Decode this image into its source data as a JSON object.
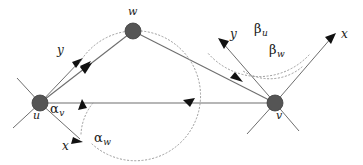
{
  "figure": {
    "type": "diagram",
    "background_color": "#ffffff",
    "node_color": "#555555",
    "line_color": "#6e6e6e",
    "arc_color": "#9a9a9a",
    "arrow_color": "#111111",
    "width": 363,
    "height": 165
  },
  "nodes": [
    {
      "id": "u",
      "label": "u",
      "x": 40,
      "y": 103,
      "radius": 8,
      "label_x": 33,
      "label_y": 112
    },
    {
      "id": "w",
      "label": "w",
      "x": 133,
      "y": 31,
      "radius": 8,
      "label_x": 128,
      "label_y": 9
    },
    {
      "id": "v",
      "label": "v",
      "x": 275,
      "y": 103,
      "radius": 8,
      "label_x": 275,
      "label_y": 112
    }
  ],
  "edges": [
    {
      "id": "u-w",
      "from": "u",
      "to": "w",
      "directed": true
    },
    {
      "id": "u-v",
      "from": "u",
      "to": "v",
      "directed": true
    },
    {
      "id": "w-v",
      "from": "w",
      "to": "v",
      "directed": true
    }
  ],
  "axes": [
    {
      "id": "u-y",
      "node": "u",
      "label": "y",
      "label_x": 58,
      "label_y": 47
    },
    {
      "id": "u-x",
      "node": "u",
      "label": "x",
      "label_x": 63,
      "label_y": 142
    },
    {
      "id": "v-y",
      "node": "v",
      "label": "y",
      "label_x": 230,
      "label_y": 30
    },
    {
      "id": "v-x",
      "node": "v",
      "label": "x",
      "label_x": 341,
      "label_y": 30
    }
  ],
  "angles": [
    {
      "id": "alpha-v",
      "symbol": "α",
      "subscript": "v",
      "at_node": "u",
      "label_x": 50,
      "label_y": 105
    },
    {
      "id": "alpha-w",
      "symbol": "α",
      "subscript": "w",
      "at_node": "u",
      "label_x": 96,
      "label_y": 134
    },
    {
      "id": "beta-u",
      "symbol": "β",
      "subscript": "u",
      "at_node": "v",
      "label_x": 255,
      "label_y": 25
    },
    {
      "id": "beta-w",
      "symbol": "β",
      "subscript": "w",
      "at_node": "v",
      "label_x": 270,
      "label_y": 46
    }
  ]
}
